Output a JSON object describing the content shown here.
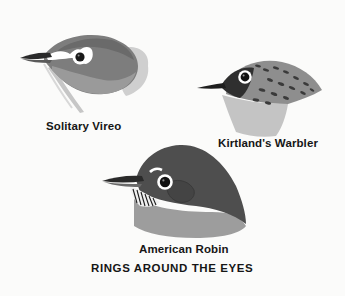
{
  "page": {
    "caption": "RINGS AROUND THE EYES",
    "colors": {
      "background": "#fbfbfa",
      "text": "#161616",
      "dark_crown": "#4a4a4a",
      "mid_gray": "#8c8c8c",
      "light_gray": "#bdbdbd",
      "eye_ring": "#ffffff"
    }
  },
  "birds": [
    {
      "name": "Solitary Vireo",
      "illustration": "solitary-vireo-head",
      "feature": "white eye-ring with spectacles"
    },
    {
      "name": "Kirtland's Warbler",
      "illustration": "kirtlands-warbler-head",
      "feature": "white eye-ring, streaked crown"
    },
    {
      "name": "American Robin",
      "illustration": "american-robin-head",
      "feature": "broken white eye-ring, streaked throat"
    }
  ]
}
